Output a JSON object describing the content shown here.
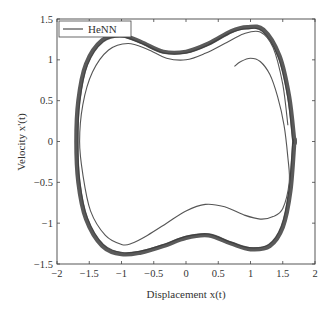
{
  "chart_data": {
    "type": "line",
    "title": "",
    "xlabel": "Displacement x(t)",
    "ylabel": "Velocity x'(t)",
    "xlim": [
      -2,
      2
    ],
    "ylim": [
      -1.5,
      1.5
    ],
    "xticks": [
      -2,
      -1.5,
      -1,
      -0.5,
      0,
      0.5,
      1,
      1.5,
      2
    ],
    "yticks": [
      -1.5,
      -1,
      -0.5,
      0,
      0.5,
      1,
      1.5
    ],
    "xtick_labels": [
      "−2",
      "−1.5",
      "−1",
      "−0.5",
      "0",
      "0.5",
      "1",
      "1.5",
      "2"
    ],
    "ytick_labels": [
      "−1.5",
      "−1",
      "−0.5",
      "0",
      "0.5",
      "1",
      "1.5"
    ],
    "grid": false,
    "legend": {
      "position": "upper left",
      "entries": [
        "HeNN"
      ]
    },
    "series": [
      {
        "name": "HeNN",
        "description": "Phase-plane trajectory starting near (0.75, 0.92), spiraling outward onto a limit cycle",
        "color": "#555555",
        "transient": {
          "x": [
            0.75,
            0.85,
            1.0,
            1.15,
            1.3,
            1.42,
            1.52,
            1.58,
            1.6
          ],
          "y": [
            0.92,
            0.98,
            1.02,
            0.98,
            0.82,
            0.55,
            0.2,
            -0.2,
            -0.5
          ]
        },
        "inner_loop": {
          "x": [
            1.6,
            1.5,
            1.35,
            1.15,
            0.9,
            0.6,
            0.3,
            0.0,
            -0.3,
            -0.6,
            -0.85,
            -1.0,
            -1.25,
            -1.48,
            -1.6,
            -1.65,
            -1.6,
            -1.45,
            -1.2,
            -0.9,
            -0.6,
            -0.3,
            0.0,
            0.3,
            0.6,
            0.9,
            1.15,
            1.35,
            1.5,
            1.58
          ],
          "y": [
            -0.5,
            -0.82,
            -0.92,
            -0.95,
            -0.9,
            -0.8,
            -0.77,
            -0.85,
            -1.0,
            -1.15,
            -1.25,
            -1.26,
            -1.15,
            -0.85,
            -0.4,
            0.0,
            0.45,
            0.85,
            1.12,
            1.2,
            1.13,
            1.02,
            1.0,
            1.08,
            1.2,
            1.32,
            1.34,
            1.15,
            0.7,
            0.2
          ]
        },
        "limit_cycle": {
          "x": [
            1.68,
            1.62,
            1.5,
            1.3,
            1.0,
            0.7,
            0.35,
            0.0,
            -0.35,
            -0.7,
            -1.0,
            -1.3,
            -1.55,
            -1.67,
            -1.7,
            -1.67,
            -1.55,
            -1.3,
            -1.0,
            -0.7,
            -0.35,
            0.0,
            0.35,
            0.7,
            0.95,
            1.2,
            1.45,
            1.6,
            1.68
          ],
          "y": [
            0.0,
            -0.6,
            -1.05,
            -1.28,
            -1.32,
            -1.25,
            -1.15,
            -1.18,
            -1.28,
            -1.36,
            -1.38,
            -1.28,
            -0.95,
            -0.5,
            0.0,
            0.5,
            0.95,
            1.24,
            1.3,
            1.22,
            1.1,
            1.1,
            1.2,
            1.35,
            1.4,
            1.37,
            1.05,
            0.55,
            0.0
          ]
        }
      }
    ]
  }
}
